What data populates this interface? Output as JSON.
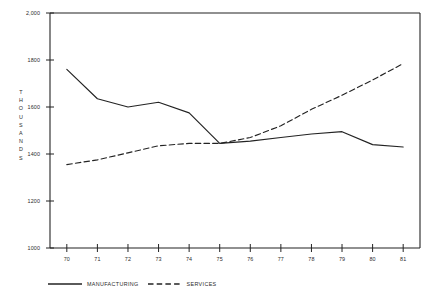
{
  "chart_data": {
    "type": "line",
    "title": "",
    "subtitle": "",
    "xlabel": "",
    "ylabel": "THOUSANDS",
    "categories": [
      "70",
      "71",
      "72",
      "73",
      "74",
      "75",
      "76",
      "77",
      "78",
      "79",
      "80",
      "81"
    ],
    "x": [
      1970,
      1971,
      1972,
      1973,
      1974,
      1975,
      1976,
      1977,
      1978,
      1979,
      1980,
      1981
    ],
    "series": [
      {
        "name": "MANUFACTURING",
        "style": "solid",
        "color": "#232323",
        "values": [
          1760,
          1635,
          1600,
          1620,
          1575,
          1445,
          1455,
          1470,
          1485,
          1495,
          1440,
          1430
        ]
      },
      {
        "name": "SERVICES",
        "style": "dashed",
        "color": "#232323",
        "values": [
          1355,
          1375,
          1405,
          1435,
          1445,
          1445,
          1470,
          1520,
          1590,
          1650,
          1715,
          1785
        ]
      }
    ],
    "ylim": [
      1000,
      2000
    ],
    "yticks": [
      1000,
      1200,
      1400,
      1600,
      1800,
      2000
    ],
    "ytick_labels": [
      "1000",
      "1200",
      "1400",
      "1600",
      "1800",
      "2,000"
    ],
    "xtick_labels": [
      "70",
      "71",
      "72",
      "73",
      "74",
      "75",
      "76",
      "77",
      "78",
      "79",
      "80",
      "81"
    ],
    "grid": false,
    "legend_position": "bottom-left",
    "axis_color": "#232323",
    "background": "#ffffff"
  },
  "ylabel_letters": [
    "T",
    "H",
    "O",
    "U",
    "S",
    "A",
    "N",
    "D",
    "S"
  ],
  "legend": {
    "entries": [
      {
        "label": "MANUFACTURING",
        "style": "solid"
      },
      {
        "label": "SERVICES",
        "style": "dashed"
      }
    ]
  }
}
